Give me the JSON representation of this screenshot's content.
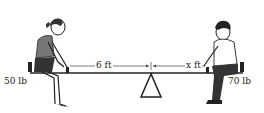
{
  "diagram": {
    "left_weight": "50 lb",
    "right_weight": "70 lb",
    "left_distance": "6 ft",
    "right_distance_var": "x",
    "right_distance_unit": "ft",
    "figures": [
      "girl seated on left end",
      "boy seated on right end"
    ],
    "fulcrum": "triangle"
  }
}
